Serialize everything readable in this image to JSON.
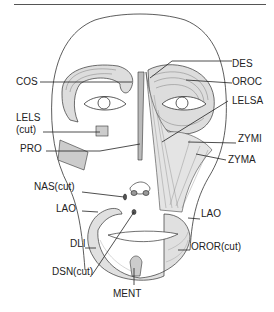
{
  "diagram": {
    "labels": [
      {
        "id": "DES",
        "text": "DES",
        "x": 232,
        "y": 64
      },
      {
        "id": "COS",
        "text": "COS",
        "x": 16,
        "y": 82
      },
      {
        "id": "OROC",
        "text": "OROC",
        "x": 232,
        "y": 82
      },
      {
        "id": "LELS",
        "text": "LELS",
        "x": 16,
        "y": 118
      },
      {
        "id": "LELS_cut",
        "text": "(cut)",
        "x": 16,
        "y": 130
      },
      {
        "id": "LELSA",
        "text": "LELSA",
        "x": 232,
        "y": 101
      },
      {
        "id": "ZYMI",
        "text": "ZYMI",
        "x": 238,
        "y": 139
      },
      {
        "id": "PRO",
        "text": "PRO",
        "x": 20,
        "y": 149
      },
      {
        "id": "ZYMA",
        "text": "ZYMA",
        "x": 228,
        "y": 160
      },
      {
        "id": "NAScut",
        "text": "NAS(cut)",
        "x": 34,
        "y": 187
      },
      {
        "id": "LAO_left",
        "text": "LAO",
        "x": 56,
        "y": 209
      },
      {
        "id": "LAO_right",
        "text": "LAO",
        "x": 201,
        "y": 214
      },
      {
        "id": "DLI",
        "text": "DLI",
        "x": 70,
        "y": 244
      },
      {
        "id": "ORORcut",
        "text": "OROR(cut)",
        "x": 191,
        "y": 247
      },
      {
        "id": "DSNcut",
        "text": "DSN(cut)",
        "x": 52,
        "y": 272
      },
      {
        "id": "MENT",
        "text": "MENT",
        "x": 113,
        "y": 294
      }
    ]
  }
}
